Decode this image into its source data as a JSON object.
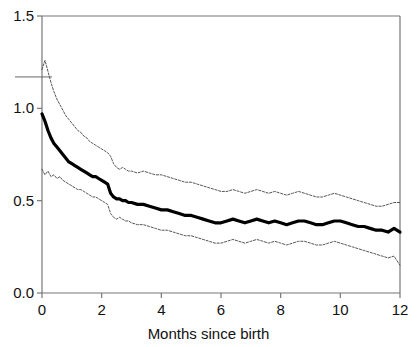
{
  "chart_data": {
    "type": "line",
    "title": "",
    "xlabel": "Months since birth",
    "ylabel": "",
    "xlim": [
      0,
      12
    ],
    "ylim": [
      0.0,
      1.5
    ],
    "grid": false,
    "legend": "none",
    "xticks": [
      "0",
      "2",
      "4",
      "6",
      "8",
      "10",
      "12"
    ],
    "xtick_values": [
      0,
      2,
      4,
      6,
      8,
      10,
      12
    ],
    "yticks": [
      "0.0",
      "0.5",
      "1.0",
      "1.5"
    ],
    "ytick_values": [
      0.0,
      0.5,
      1.0,
      1.5
    ],
    "colors": {
      "estimate": "#000000",
      "band": "#555555",
      "axis": "#777777"
    },
    "annotations": [
      {
        "name": "stray-rule",
        "x_start_px": 15,
        "x_end_px": 52,
        "y_value": 1.17
      }
    ],
    "series": [
      {
        "name": "upper confidence limit",
        "style": "thin-dotted",
        "x": [
          0.0,
          0.1,
          0.2,
          0.3,
          0.4,
          0.5,
          0.6,
          0.7,
          0.8,
          0.9,
          1.0,
          1.1,
          1.2,
          1.3,
          1.4,
          1.5,
          1.6,
          1.7,
          1.8,
          1.9,
          2.0,
          2.1,
          2.2,
          2.3,
          2.4,
          2.5,
          2.6,
          2.7,
          2.8,
          2.9,
          3.0,
          3.2,
          3.4,
          3.6,
          3.8,
          4.0,
          4.2,
          4.4,
          4.6,
          4.8,
          5.0,
          5.2,
          5.4,
          5.6,
          5.8,
          6.0,
          6.2,
          6.4,
          6.6,
          6.8,
          7.0,
          7.2,
          7.4,
          7.6,
          7.8,
          8.0,
          8.2,
          8.4,
          8.6,
          8.8,
          9.0,
          9.2,
          9.4,
          9.6,
          9.8,
          10.0,
          10.2,
          10.4,
          10.6,
          10.8,
          11.0,
          11.2,
          11.4,
          11.6,
          11.8,
          12.0
        ],
        "y": [
          1.21,
          1.26,
          1.2,
          1.14,
          1.09,
          1.05,
          1.02,
          0.99,
          0.96,
          0.94,
          0.92,
          0.9,
          0.88,
          0.87,
          0.85,
          0.84,
          0.82,
          0.81,
          0.8,
          0.79,
          0.78,
          0.77,
          0.76,
          0.74,
          0.7,
          0.68,
          0.67,
          0.68,
          0.67,
          0.66,
          0.66,
          0.65,
          0.66,
          0.65,
          0.64,
          0.64,
          0.63,
          0.62,
          0.61,
          0.6,
          0.6,
          0.59,
          0.58,
          0.57,
          0.56,
          0.55,
          0.55,
          0.56,
          0.55,
          0.54,
          0.55,
          0.56,
          0.55,
          0.54,
          0.55,
          0.54,
          0.53,
          0.54,
          0.55,
          0.54,
          0.53,
          0.52,
          0.52,
          0.53,
          0.54,
          0.53,
          0.52,
          0.51,
          0.5,
          0.49,
          0.48,
          0.47,
          0.47,
          0.48,
          0.49,
          0.49
        ]
      },
      {
        "name": "hazard ratio estimate",
        "style": "bold-solid",
        "x": [
          0.0,
          0.1,
          0.2,
          0.3,
          0.4,
          0.5,
          0.6,
          0.7,
          0.8,
          0.9,
          1.0,
          1.1,
          1.2,
          1.3,
          1.4,
          1.5,
          1.6,
          1.7,
          1.8,
          1.9,
          2.0,
          2.1,
          2.2,
          2.3,
          2.4,
          2.5,
          2.6,
          2.7,
          2.8,
          2.9,
          3.0,
          3.2,
          3.4,
          3.6,
          3.8,
          4.0,
          4.2,
          4.4,
          4.6,
          4.8,
          5.0,
          5.2,
          5.4,
          5.6,
          5.8,
          6.0,
          6.2,
          6.4,
          6.6,
          6.8,
          7.0,
          7.2,
          7.4,
          7.6,
          7.8,
          8.0,
          8.2,
          8.4,
          8.6,
          8.8,
          9.0,
          9.2,
          9.4,
          9.6,
          9.8,
          10.0,
          10.2,
          10.4,
          10.6,
          10.8,
          11.0,
          11.2,
          11.4,
          11.6,
          11.8,
          12.0
        ],
        "y": [
          0.97,
          0.93,
          0.88,
          0.84,
          0.81,
          0.79,
          0.77,
          0.75,
          0.73,
          0.71,
          0.7,
          0.69,
          0.68,
          0.67,
          0.66,
          0.65,
          0.64,
          0.63,
          0.63,
          0.62,
          0.61,
          0.6,
          0.59,
          0.54,
          0.52,
          0.51,
          0.51,
          0.5,
          0.5,
          0.49,
          0.49,
          0.48,
          0.48,
          0.47,
          0.46,
          0.45,
          0.45,
          0.44,
          0.43,
          0.42,
          0.42,
          0.41,
          0.4,
          0.39,
          0.38,
          0.38,
          0.39,
          0.4,
          0.39,
          0.38,
          0.39,
          0.4,
          0.39,
          0.38,
          0.39,
          0.38,
          0.37,
          0.38,
          0.39,
          0.39,
          0.38,
          0.37,
          0.37,
          0.38,
          0.39,
          0.39,
          0.38,
          0.37,
          0.36,
          0.36,
          0.35,
          0.34,
          0.34,
          0.33,
          0.35,
          0.33
        ]
      },
      {
        "name": "lower confidence limit",
        "style": "thin-dotted",
        "x": [
          0.0,
          0.1,
          0.2,
          0.3,
          0.4,
          0.5,
          0.6,
          0.7,
          0.8,
          0.9,
          1.0,
          1.1,
          1.2,
          1.3,
          1.4,
          1.5,
          1.6,
          1.7,
          1.8,
          1.9,
          2.0,
          2.1,
          2.2,
          2.3,
          2.4,
          2.5,
          2.6,
          2.7,
          2.8,
          2.9,
          3.0,
          3.2,
          3.4,
          3.6,
          3.8,
          4.0,
          4.2,
          4.4,
          4.6,
          4.8,
          5.0,
          5.2,
          5.4,
          5.6,
          5.8,
          6.0,
          6.2,
          6.4,
          6.6,
          6.8,
          7.0,
          7.2,
          7.4,
          7.6,
          7.8,
          8.0,
          8.2,
          8.4,
          8.6,
          8.8,
          9.0,
          9.2,
          9.4,
          9.6,
          9.8,
          10.0,
          10.2,
          10.4,
          10.6,
          10.8,
          11.0,
          11.2,
          11.4,
          11.6,
          11.8,
          12.0
        ],
        "y": [
          0.67,
          0.64,
          0.66,
          0.63,
          0.64,
          0.62,
          0.63,
          0.61,
          0.6,
          0.59,
          0.58,
          0.57,
          0.56,
          0.56,
          0.55,
          0.54,
          0.53,
          0.52,
          0.52,
          0.51,
          0.5,
          0.49,
          0.48,
          0.43,
          0.41,
          0.4,
          0.41,
          0.4,
          0.39,
          0.39,
          0.38,
          0.37,
          0.37,
          0.36,
          0.35,
          0.34,
          0.34,
          0.33,
          0.32,
          0.31,
          0.31,
          0.3,
          0.29,
          0.28,
          0.27,
          0.27,
          0.28,
          0.29,
          0.28,
          0.27,
          0.28,
          0.29,
          0.28,
          0.27,
          0.28,
          0.27,
          0.26,
          0.27,
          0.28,
          0.28,
          0.27,
          0.26,
          0.26,
          0.27,
          0.28,
          0.27,
          0.26,
          0.25,
          0.24,
          0.23,
          0.22,
          0.21,
          0.2,
          0.19,
          0.2,
          0.15
        ]
      }
    ]
  }
}
